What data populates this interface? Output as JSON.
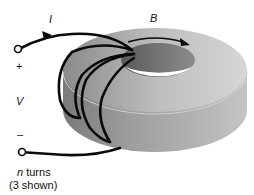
{
  "diagram": {
    "type": "toroidal-coil",
    "labels": {
      "current": "I",
      "field": "B",
      "plus": "+",
      "voltage": "V",
      "minus": "–",
      "turns_var": "n",
      "turns_word": " turns",
      "turns_note": "(3 shown)"
    },
    "colors": {
      "core_top": "#c8c8c8",
      "core_side": "#a9a9a9",
      "core_dark": "#6e6e6e",
      "wire": "#0a0a0a",
      "background": "#ffffff"
    }
  }
}
